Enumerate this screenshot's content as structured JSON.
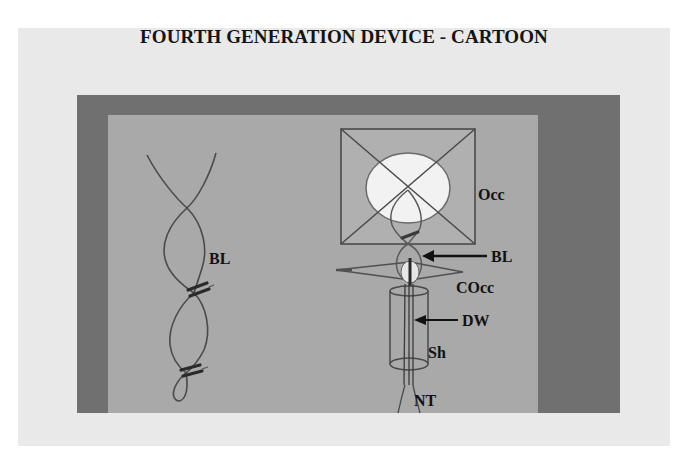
{
  "slide": {
    "title": "FOURTH GENERATION DEVICE - CARTOON",
    "colors": {
      "background": "#e9e9e9",
      "frame": "#707070",
      "panel": "#a9a9a9",
      "line": "#3c3c3c",
      "occluder_disc": "#f2f2f2"
    }
  },
  "left_figure": {
    "description": "Twisted bridging leaflets with clips",
    "labels": {
      "bl": "BL"
    }
  },
  "right_figure": {
    "description": "Device with occluder, cone occluder, delivery wire, sheath and neo-tendon",
    "labels": {
      "occ": "Occ",
      "bl": "BL",
      "cocc": "COcc",
      "dw": "DW",
      "sh": "Sh",
      "nt": "NT"
    }
  }
}
